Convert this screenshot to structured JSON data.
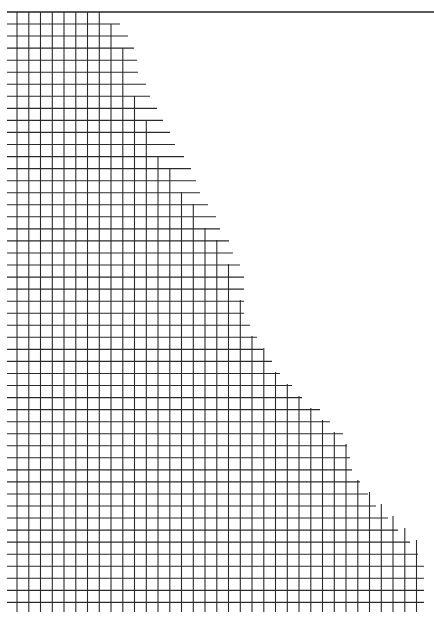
{
  "figure": {
    "width": 434,
    "height": 623,
    "line_color": "#2a2a2a",
    "background": "#ffffff",
    "top_rule": {
      "y": 12,
      "x1": 7,
      "x2": 434
    },
    "grid": {
      "h_start_x": 7,
      "row_y0": 24,
      "row_step": 12.05,
      "row_count": 49,
      "col_x0": 17,
      "col_step": 11.75,
      "col_count": 35,
      "v_bottom": 612,
      "row_right_x": [
        120,
        128,
        134,
        137,
        138,
        146,
        150,
        157,
        163,
        170,
        175,
        184,
        191,
        196,
        200,
        208,
        216,
        220,
        229,
        233,
        240,
        244,
        244,
        244,
        244,
        250,
        257,
        263,
        272,
        280,
        292,
        302,
        320,
        330,
        343,
        347,
        350,
        352,
        360,
        368,
        376,
        388,
        398,
        410,
        418,
        424,
        424,
        424,
        424
      ],
      "col_top_y": [
        12,
        12,
        12,
        12,
        12,
        12,
        12,
        12,
        24,
        48,
        96,
        120,
        156,
        168,
        192,
        204,
        228,
        240,
        264,
        300,
        336,
        348,
        372,
        384,
        396,
        408,
        420,
        432,
        444,
        480,
        492,
        504,
        516,
        528,
        540
      ]
    }
  }
}
